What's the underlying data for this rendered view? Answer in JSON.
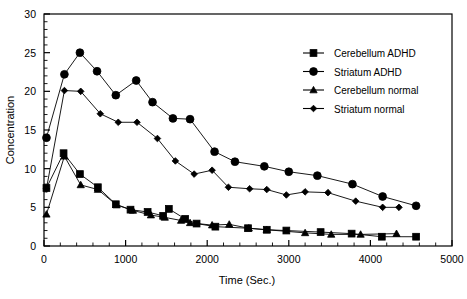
{
  "chart_data": {
    "type": "line",
    "title": "",
    "xlabel": "Time (Sec.)",
    "ylabel": "Concentration",
    "xlim": [
      0,
      5000
    ],
    "ylim": [
      0,
      30
    ],
    "xticks": [
      0,
      1000,
      2000,
      3000,
      4000,
      5000
    ],
    "xtick_labels": [
      "0",
      "1000",
      "2000",
      "3000",
      "4000",
      "5000"
    ],
    "yticks": [
      0,
      5,
      10,
      15,
      20,
      25,
      30
    ],
    "ytick_labels": [
      "0",
      "5",
      "10",
      "15",
      "20",
      "25",
      "30"
    ],
    "x_minor_step": 200,
    "y_minor_step": 1,
    "grid": false,
    "legend_position": "upper right",
    "series": [
      {
        "name": "Cerebellum ADHD",
        "marker": "square",
        "color": "#000000",
        "points": [
          [
            30,
            7.5
          ],
          [
            240,
            12.0
          ],
          [
            440,
            9.3
          ],
          [
            660,
            7.6
          ],
          [
            880,
            5.4
          ],
          [
            1060,
            4.7
          ],
          [
            1270,
            4.4
          ],
          [
            1460,
            3.9
          ],
          [
            1530,
            4.8
          ],
          [
            1730,
            3.5
          ],
          [
            1870,
            2.9
          ],
          [
            2100,
            2.5
          ],
          [
            2500,
            2.3
          ],
          [
            2730,
            2.1
          ],
          [
            2970,
            2.0
          ],
          [
            3390,
            1.8
          ],
          [
            3770,
            1.6
          ],
          [
            4140,
            1.2
          ],
          [
            4560,
            1.2
          ]
        ]
      },
      {
        "name": "Striatum ADHD",
        "marker": "circle",
        "color": "#000000",
        "points": [
          [
            30,
            14.0
          ],
          [
            250,
            22.2
          ],
          [
            440,
            25.0
          ],
          [
            650,
            22.6
          ],
          [
            880,
            19.5
          ],
          [
            1130,
            21.4
          ],
          [
            1330,
            18.6
          ],
          [
            1580,
            16.5
          ],
          [
            1790,
            16.4
          ],
          [
            2090,
            12.2
          ],
          [
            2340,
            10.9
          ],
          [
            2700,
            10.3
          ],
          [
            3000,
            9.6
          ],
          [
            3350,
            9.1
          ],
          [
            3780,
            8.0
          ],
          [
            4150,
            6.4
          ],
          [
            4560,
            5.2
          ]
        ]
      },
      {
        "name": "Cerebellum normal",
        "marker": "triangle",
        "color": "#000000",
        "points": [
          [
            30,
            4.1
          ],
          [
            250,
            11.6
          ],
          [
            450,
            7.9
          ],
          [
            660,
            7.3
          ],
          [
            890,
            5.3
          ],
          [
            1090,
            4.6
          ],
          [
            1310,
            4.0
          ],
          [
            1480,
            3.7
          ],
          [
            1680,
            3.3
          ],
          [
            1790,
            3.0
          ],
          [
            2060,
            2.7
          ],
          [
            2270,
            2.8
          ],
          [
            2510,
            2.3
          ],
          [
            2730,
            2.1
          ],
          [
            3200,
            1.7
          ],
          [
            3520,
            1.5
          ],
          [
            3880,
            1.5
          ],
          [
            4320,
            1.6
          ]
        ]
      },
      {
        "name": "Striatum normal",
        "marker": "diamond",
        "color": "#000000",
        "points": [
          [
            30,
            7.4
          ],
          [
            250,
            20.1
          ],
          [
            450,
            20.0
          ],
          [
            690,
            17.1
          ],
          [
            910,
            16.0
          ],
          [
            1140,
            16.0
          ],
          [
            1390,
            13.9
          ],
          [
            1610,
            11.0
          ],
          [
            1840,
            9.3
          ],
          [
            2060,
            9.8
          ],
          [
            2260,
            7.6
          ],
          [
            2520,
            7.4
          ],
          [
            2730,
            7.3
          ],
          [
            2970,
            6.6
          ],
          [
            3200,
            7.0
          ],
          [
            3480,
            6.9
          ],
          [
            3820,
            5.8
          ],
          [
            4150,
            5.0
          ],
          [
            4350,
            5.0
          ]
        ]
      }
    ]
  },
  "legend": {
    "items": [
      {
        "label": "Cerebellum ADHD",
        "marker": "square-marker"
      },
      {
        "label": "Striatum ADHD",
        "marker": "circle-marker"
      },
      {
        "label": "Cerebellum normal",
        "marker": "triangle-marker"
      },
      {
        "label": "Striatum normal",
        "marker": "diamond-marker"
      }
    ]
  },
  "axes": {
    "x_title": "Time (Sec.)",
    "y_title": "Concentration"
  }
}
